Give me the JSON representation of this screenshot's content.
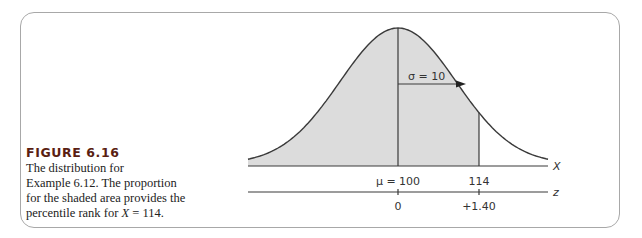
{
  "figure": {
    "title": "FIGURE 6.16",
    "caption_lines": [
      "The distribution for",
      "Example 6.12. The proportion",
      "for the shaded area provides the"
    ],
    "caption_last_prefix": "percentile rank for ",
    "caption_last_var": "X",
    "caption_last_suffix": " = 114."
  },
  "diagram": {
    "sigma_label": "σ = 10",
    "x_axis_label": "X",
    "z_axis_label": "z",
    "x_ticks": [
      "μ = 100",
      "114"
    ],
    "z_ticks": [
      "0",
      "+1.40"
    ],
    "shade_color": "#dcdcdc",
    "line_color": "#3a3a3a"
  },
  "chart_data": {
    "type": "area",
    "mean": 100,
    "sd": 10,
    "shaded_region": {
      "from": "-inf",
      "to": 114
    },
    "x_markers": [
      100,
      114
    ],
    "z_markers": [
      0,
      1.4
    ],
    "xlabel": "X",
    "zlabel": "z"
  }
}
